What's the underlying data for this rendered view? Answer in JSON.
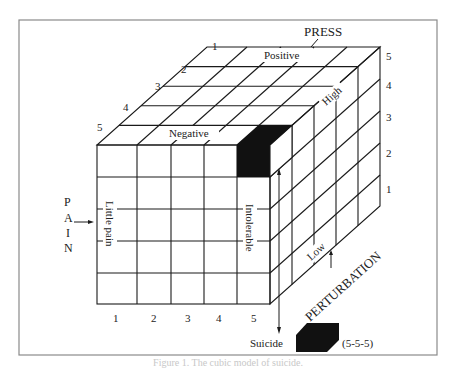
{
  "figure": {
    "title": "Cubic model of suicide",
    "caption": "Figure 1. The cubic model of suicide.",
    "axes": {
      "press": {
        "name": "PRESS",
        "low_label": "Negative",
        "high_label": "Positive",
        "ticks": [
          "1",
          "2",
          "3",
          "4",
          "5"
        ]
      },
      "pain": {
        "name": "PAIN",
        "letters": [
          "P",
          "A",
          "I",
          "N"
        ],
        "low_label": "Little pain",
        "high_label": "Intolerable",
        "ticks": [
          "1",
          "2",
          "3",
          "4",
          "5"
        ]
      },
      "perturbation": {
        "name": "PERTURBATION",
        "low_label": "Low",
        "high_label": "High",
        "ticks": [
          "1",
          "2",
          "3",
          "4",
          "5"
        ]
      }
    },
    "depth_ticks": [
      "1",
      "2",
      "3",
      "4",
      "5"
    ],
    "bottom_ticks": [
      "1",
      "2",
      "3",
      "4",
      "5"
    ],
    "right_ticks": [
      "5",
      "4",
      "3",
      "2",
      "1"
    ],
    "outcome": {
      "label": "Suicide",
      "cell": "(5-5-5)"
    },
    "colors": {
      "line": "#1a1a1a",
      "fill_dark": "#111111",
      "frame": "#8a8a8a",
      "background": "#ffffff"
    }
  }
}
